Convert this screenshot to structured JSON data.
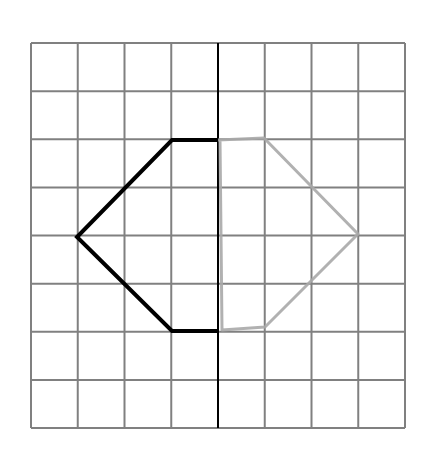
{
  "diagram": {
    "type": "reflection-grid",
    "grid": {
      "cols": 8,
      "rows": 8,
      "x0": 31,
      "y0": 43,
      "x1": 405,
      "y1": 428,
      "line_color": "#808080"
    },
    "mirror_line": {
      "x": 218,
      "y_top": 43,
      "y_bottom": 428,
      "color": "#000000"
    },
    "original_shape": {
      "color": "#000000",
      "points": [
        [
          218,
          140
        ],
        [
          172,
          140
        ],
        [
          77,
          237
        ],
        [
          172,
          331
        ],
        [
          218,
          331
        ]
      ]
    },
    "sketched_reflection": {
      "color": "#a8a8a8",
      "points": [
        [
          218,
          140
        ],
        [
          264,
          138
        ],
        [
          358,
          234
        ],
        [
          302,
          290
        ],
        [
          265,
          327
        ],
        [
          222,
          330
        ],
        [
          220,
          140
        ]
      ]
    }
  }
}
